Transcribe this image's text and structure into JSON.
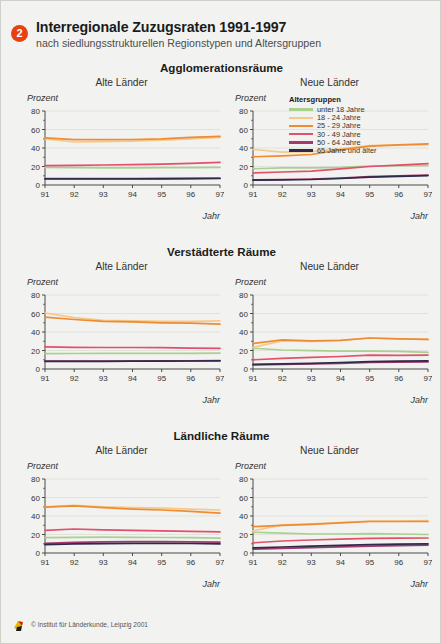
{
  "header": {
    "badge": "2",
    "title": "Interregionale Zuzugsraten 1991-1997",
    "subtitle": "nach siedlungsstrukturellen Regionstypen und Altersgruppen"
  },
  "legend": {
    "title": "Altersgruppen",
    "items": [
      {
        "label": "unter 18 Jahre",
        "color": "#a9d18e"
      },
      {
        "label": "18 - 24 Jahre",
        "color": "#f5c98a"
      },
      {
        "label": "25 - 29 Jahre",
        "color": "#ef8b33"
      },
      {
        "label": "30 - 49 Jahre",
        "color": "#e2506b"
      },
      {
        "label": "50 - 64 Jahre",
        "color": "#a23a6e"
      },
      {
        "label": "65 Jahre und älter",
        "color": "#2d2a4a"
      }
    ]
  },
  "panel_labels": {
    "west": "Alte Länder",
    "east": "Neue Länder",
    "ylabel": "Prozent",
    "xlabel": "Jahr"
  },
  "footer": {
    "credit": "© Institut für Länderkunde, Leipzig 2001"
  },
  "chart_data": [
    {
      "type": "line",
      "title": "Agglomerationsräume",
      "panel": "Alte Länder",
      "xlabel": "Jahr",
      "ylabel": "Prozent",
      "x": [
        "91",
        "92",
        "93",
        "94",
        "95",
        "96",
        "97"
      ],
      "ylim": [
        0,
        80
      ],
      "yticks": [
        0,
        20,
        40,
        60,
        80
      ],
      "grid": true,
      "legend_position": "none",
      "series": [
        {
          "name": "unter 18 Jahre",
          "color": "#a9d18e",
          "values": [
            19.0,
            18.8,
            18.6,
            18.6,
            18.7,
            18.8,
            19.0
          ]
        },
        {
          "name": "18 - 24 Jahre",
          "color": "#f5c98a",
          "values": [
            50.0,
            46.5,
            46.8,
            47.5,
            48.5,
            50.0,
            51.5
          ]
        },
        {
          "name": "25 - 29 Jahre",
          "color": "#ef8b33",
          "values": [
            51.0,
            49.0,
            49.0,
            49.2,
            50.0,
            51.5,
            52.5
          ]
        },
        {
          "name": "30 - 49 Jahre",
          "color": "#e2506b",
          "values": [
            21.0,
            21.3,
            21.6,
            22.0,
            22.6,
            23.4,
            24.5
          ]
        },
        {
          "name": "50 - 64 Jahre",
          "color": "#a23a6e",
          "values": [
            7.0,
            7.0,
            7.0,
            7.0,
            7.1,
            7.2,
            7.4
          ]
        },
        {
          "name": "65 Jahre und älter",
          "color": "#2d2a4a",
          "values": [
            6.6,
            6.6,
            6.6,
            6.6,
            6.7,
            6.8,
            7.0
          ]
        }
      ]
    },
    {
      "type": "line",
      "title": "Agglomerationsräume",
      "panel": "Neue Länder",
      "xlabel": "Jahr",
      "ylabel": "Prozent",
      "x": [
        "91",
        "92",
        "93",
        "94",
        "95",
        "96",
        "97"
      ],
      "ylim": [
        0,
        80
      ],
      "yticks": [
        0,
        20,
        40,
        60,
        80
      ],
      "grid": true,
      "legend_position": "inside-top-right",
      "series": [
        {
          "name": "unter 18 Jahre",
          "color": "#a9d18e",
          "values": [
            17.5,
            18.6,
            18.5,
            19.0,
            20.5,
            21.0,
            21.0
          ]
        },
        {
          "name": "18 - 24 Jahre",
          "color": "#f5c98a",
          "values": [
            38.5,
            35.5,
            36.0,
            39.0,
            42.5,
            43.0,
            43.5
          ]
        },
        {
          "name": "25 - 29 Jahre",
          "color": "#ef8b33",
          "values": [
            30.5,
            31.5,
            33.0,
            38.0,
            42.0,
            43.5,
            44.5
          ]
        },
        {
          "name": "30 - 49 Jahre",
          "color": "#e2506b",
          "values": [
            13.0,
            14.0,
            15.0,
            17.5,
            20.0,
            21.5,
            23.0
          ]
        },
        {
          "name": "50 - 64 Jahre",
          "color": "#a23a6e",
          "values": [
            5.5,
            6.0,
            6.5,
            7.5,
            9.0,
            10.0,
            10.8
          ]
        },
        {
          "name": "65 Jahre und älter",
          "color": "#2d2a4a",
          "values": [
            5.2,
            5.6,
            6.0,
            7.0,
            8.4,
            9.4,
            10.2
          ]
        }
      ]
    },
    {
      "type": "line",
      "title": "Verstädterte Räume",
      "panel": "Alte Länder",
      "xlabel": "Jahr",
      "ylabel": "Prozent",
      "x": [
        "91",
        "92",
        "93",
        "94",
        "95",
        "96",
        "97"
      ],
      "ylim": [
        0,
        80
      ],
      "yticks": [
        0,
        20,
        40,
        60,
        80
      ],
      "grid": true,
      "legend_position": "none",
      "series": [
        {
          "name": "unter 18 Jahre",
          "color": "#a9d18e",
          "values": [
            16.5,
            16.8,
            17.0,
            17.0,
            17.0,
            17.0,
            17.2
          ]
        },
        {
          "name": "18 - 24 Jahre",
          "color": "#f5c98a",
          "values": [
            60.5,
            55.5,
            52.5,
            52.0,
            51.5,
            51.5,
            52.0
          ]
        },
        {
          "name": "25 - 29 Jahre",
          "color": "#ef8b33",
          "values": [
            56.0,
            53.5,
            51.5,
            51.0,
            50.0,
            49.5,
            48.5
          ]
        },
        {
          "name": "30 - 49 Jahre",
          "color": "#e2506b",
          "values": [
            24.0,
            23.5,
            23.2,
            23.2,
            23.0,
            22.5,
            22.3
          ]
        },
        {
          "name": "50 - 64 Jahre",
          "color": "#a23a6e",
          "values": [
            8.5,
            8.5,
            8.6,
            8.7,
            8.8,
            8.9,
            9.2
          ]
        },
        {
          "name": "65 Jahre und älter",
          "color": "#2d2a4a",
          "values": [
            8.2,
            8.2,
            8.3,
            8.4,
            8.5,
            8.6,
            8.9
          ]
        }
      ]
    },
    {
      "type": "line",
      "title": "Verstädterte Räume",
      "panel": "Neue Länder",
      "xlabel": "Jahr",
      "ylabel": "Prozent",
      "x": [
        "91",
        "92",
        "93",
        "94",
        "95",
        "96",
        "97"
      ],
      "ylim": [
        0,
        80
      ],
      "yticks": [
        0,
        20,
        40,
        60,
        80
      ],
      "grid": true,
      "legend_position": "none",
      "series": [
        {
          "name": "unter 18 Jahre",
          "color": "#a9d18e",
          "values": [
            22.5,
            20.5,
            19.8,
            19.3,
            19.2,
            19.0,
            18.0
          ]
        },
        {
          "name": "18 - 24 Jahre",
          "color": "#f5c98a",
          "values": [
            23.5,
            30.5,
            30.0,
            31.0,
            33.5,
            32.5,
            32.0
          ]
        },
        {
          "name": "25 - 29 Jahre",
          "color": "#ef8b33",
          "values": [
            27.5,
            31.5,
            30.5,
            31.0,
            33.5,
            32.5,
            32.0
          ]
        },
        {
          "name": "30 - 49 Jahre",
          "color": "#e2506b",
          "values": [
            10.0,
            11.5,
            12.5,
            13.5,
            15.0,
            14.8,
            15.0
          ]
        },
        {
          "name": "50 - 64 Jahre",
          "color": "#a23a6e",
          "values": [
            4.5,
            5.0,
            5.5,
            6.2,
            7.0,
            7.5,
            7.8
          ]
        },
        {
          "name": "65 Jahre und älter",
          "color": "#2d2a4a",
          "values": [
            5.0,
            5.6,
            6.2,
            7.0,
            8.0,
            8.5,
            8.8
          ]
        }
      ]
    },
    {
      "type": "line",
      "title": "Ländliche Räume",
      "panel": "Alte Länder",
      "xlabel": "Jahr",
      "ylabel": "Prozent",
      "x": [
        "91",
        "92",
        "93",
        "94",
        "95",
        "96",
        "97"
      ],
      "ylim": [
        0,
        80
      ],
      "yticks": [
        0,
        20,
        40,
        60,
        80
      ],
      "grid": true,
      "legend_position": "none",
      "series": [
        {
          "name": "unter 18 Jahre",
          "color": "#a9d18e",
          "values": [
            16.5,
            17.0,
            17.2,
            17.0,
            16.8,
            16.5,
            16.0
          ]
        },
        {
          "name": "18 - 24 Jahre",
          "color": "#f5c98a",
          "values": [
            50.0,
            51.5,
            50.0,
            49.0,
            48.5,
            47.5,
            46.5
          ]
        },
        {
          "name": "25 - 29 Jahre",
          "color": "#ef8b33",
          "values": [
            49.5,
            51.0,
            49.0,
            47.5,
            46.5,
            45.0,
            43.0
          ]
        },
        {
          "name": "30 - 49 Jahre",
          "color": "#e2506b",
          "values": [
            24.5,
            26.0,
            25.0,
            24.5,
            24.0,
            23.5,
            22.8
          ]
        },
        {
          "name": "50 - 64 Jahre",
          "color": "#a23a6e",
          "values": [
            10.5,
            11.5,
            12.0,
            12.2,
            12.2,
            12.0,
            11.8
          ]
        },
        {
          "name": "65 Jahre und älter",
          "color": "#2d2a4a",
          "values": [
            9.0,
            9.8,
            10.2,
            10.4,
            10.4,
            10.3,
            10.0
          ]
        }
      ]
    },
    {
      "type": "line",
      "title": "Ländliche Räume",
      "panel": "Neue Länder",
      "xlabel": "Jahr",
      "ylabel": "Prozent",
      "x": [
        "91",
        "92",
        "93",
        "94",
        "95",
        "96",
        "97"
      ],
      "ylim": [
        0,
        80
      ],
      "yticks": [
        0,
        20,
        40,
        60,
        80
      ],
      "grid": true,
      "legend_position": "none",
      "series": [
        {
          "name": "unter 18 Jahre",
          "color": "#a9d18e",
          "values": [
            22.5,
            21.5,
            20.5,
            20.5,
            21.0,
            20.5,
            20.0
          ]
        },
        {
          "name": "18 - 24 Jahre",
          "color": "#f5c98a",
          "values": [
            24.0,
            30.5,
            31.5,
            33.0,
            34.5,
            34.5,
            35.0
          ]
        },
        {
          "name": "25 - 29 Jahre",
          "color": "#ef8b33",
          "values": [
            28.5,
            30.0,
            31.0,
            32.5,
            34.0,
            34.0,
            34.0
          ]
        },
        {
          "name": "30 - 49 Jahre",
          "color": "#e2506b",
          "values": [
            11.0,
            13.0,
            14.0,
            15.0,
            15.8,
            16.0,
            16.2
          ]
        },
        {
          "name": "50 - 64 Jahre",
          "color": "#a23a6e",
          "values": [
            4.2,
            5.0,
            5.8,
            6.6,
            7.4,
            8.0,
            8.4
          ]
        },
        {
          "name": "65 Jahre und älter",
          "color": "#2d2a4a",
          "values": [
            5.5,
            6.5,
            7.4,
            8.3,
            9.0,
            9.6,
            10.0
          ]
        }
      ]
    }
  ]
}
